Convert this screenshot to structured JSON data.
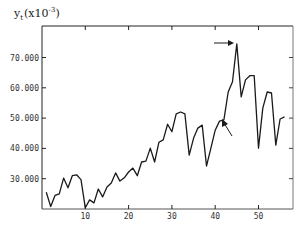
{
  "chart_data": {
    "type": "line",
    "title": "",
    "ylabel": "y_t (x10^-3)",
    "ylabel_parts": {
      "symbol": "y",
      "subscript": "t",
      "scale_prefix": "(x10",
      "scale_exp": "-3",
      "scale_suffix": ")"
    },
    "xlabel": "",
    "xlim": [
      0,
      58
    ],
    "ylim": [
      20,
      80
    ],
    "grid": false,
    "legend": null,
    "x_ticks": [
      10,
      20,
      30,
      40,
      50
    ],
    "x_tick_labels": [
      "10",
      "20",
      "30",
      "40",
      "50"
    ],
    "y_ticks": [
      30,
      40,
      50,
      60,
      70
    ],
    "y_tick_labels": [
      "30.000",
      "40.000",
      "50.000",
      "60.000",
      "70.000"
    ],
    "series": [
      {
        "name": "y_t",
        "x": [
          1,
          2,
          3,
          4,
          5,
          6,
          7,
          8,
          9,
          10,
          11,
          12,
          13,
          14,
          15,
          16,
          17,
          18,
          19,
          20,
          21,
          22,
          23,
          24,
          25,
          26,
          27,
          28,
          29,
          30,
          31,
          32,
          33,
          34,
          35,
          36,
          37,
          38,
          39,
          40,
          41,
          42,
          43,
          44,
          45,
          46,
          47,
          48,
          49,
          50,
          51,
          52,
          53,
          54,
          55,
          56
        ],
        "values": [
          25.5,
          20.8,
          24.5,
          25.0,
          30.2,
          27.0,
          31.0,
          31.3,
          29.7,
          20.4,
          23.0,
          22.0,
          26.6,
          24.0,
          27.3,
          28.6,
          31.9,
          29.2,
          30.3,
          32.2,
          33.5,
          31.0,
          35.5,
          35.8,
          40.1,
          35.5,
          42.0,
          42.8,
          48.0,
          45.5,
          51.4,
          52.0,
          51.4,
          37.8,
          43.4,
          46.7,
          47.7,
          34.2,
          40.1,
          46.0,
          49.0,
          49.4,
          58.6,
          62.0,
          74.5,
          57.0,
          62.6,
          64.0,
          64.0,
          40.1,
          53.3,
          58.6,
          58.3,
          41.1,
          49.7,
          50.4
        ]
      }
    ],
    "annotations": [
      {
        "type": "arrow",
        "description": "horizontal arrow pointing to peak",
        "target_x": 45,
        "target_y": 74.5
      },
      {
        "type": "arrow",
        "description": "diagonal arrow pointing to level shift",
        "target_x": 42,
        "target_y": 49.4
      }
    ]
  }
}
